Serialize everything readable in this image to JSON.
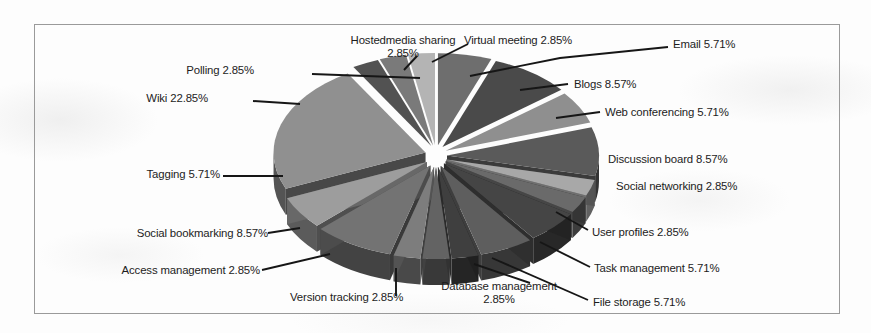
{
  "figure": {
    "type": "exploded-3d-pie",
    "border_color": "#9a9a9a",
    "background_color": "#fdfdfd"
  },
  "chart_data": {
    "type": "pie",
    "title": "",
    "subtitle": "",
    "xlabel": "",
    "ylabel": "",
    "legend_position": "none",
    "exploded": true,
    "three_d": true,
    "units": "percent",
    "categories": [
      "Email",
      "Blogs",
      "Web conferencing",
      "Discussion board",
      "Social networking",
      "User profiles",
      "Task management",
      "File storage",
      "Database management",
      "Version tracking",
      "Access management",
      "Social bookmarking",
      "Tagging",
      "Wiki",
      "Polling",
      "Hostedmedia sharing",
      "Virtual meeting"
    ],
    "values": [
      5.71,
      8.57,
      5.71,
      8.57,
      2.85,
      2.85,
      5.71,
      5.71,
      2.85,
      2.85,
      2.85,
      8.57,
      5.71,
      22.85,
      2.85,
      2.85,
      2.85
    ],
    "value_labels": [
      "5.71%",
      "8.57%",
      "5.71%",
      "8.57%",
      "2.85%",
      "2.85%",
      "5.71%",
      "5.71%",
      "2.85%",
      "2.85%",
      "2.85%",
      "8.57%",
      "5.71%",
      "22.85%",
      "2.85%",
      "2.85%",
      "2.85%"
    ],
    "slice_colors": [
      "#6e6e6e",
      "#4a4a4a",
      "#8f8f8f",
      "#5a5a5a",
      "#a8a8a8",
      "#6a6a6a",
      "#454545",
      "#5e5e5e",
      "#3f3f3f",
      "#636363",
      "#7d7d7d",
      "#737373",
      "#9d9d9d",
      "#909090",
      "#525252",
      "#7a7a7a",
      "#b4b4b4"
    ]
  },
  "labels": [
    {
      "id": "hostedmedia-sharing",
      "name": "Hostedmedia sharing",
      "percent": "2.85%",
      "text": "Hostedmedia sharing 2.85%"
    },
    {
      "id": "virtual-meeting",
      "name": "Virtual meeting",
      "percent": "2.85%",
      "text": "Virtual meeting 2.85%"
    },
    {
      "id": "email",
      "name": "Email",
      "percent": "5.71%",
      "text": "Email 5.71%"
    },
    {
      "id": "polling",
      "name": "Polling",
      "percent": "2.85%",
      "text": "Polling 2.85%"
    },
    {
      "id": "blogs",
      "name": "Blogs",
      "percent": "8.57%",
      "text": "Blogs 8.57%"
    },
    {
      "id": "wiki",
      "name": "Wiki",
      "percent": "22.85%",
      "text": "Wiki 22.85%"
    },
    {
      "id": "web-conferencing",
      "name": "Web conferencing",
      "percent": "5.71%",
      "text": "Web conferencing 5.71%"
    },
    {
      "id": "discussion-board",
      "name": "Discussion board",
      "percent": "8.57%",
      "text": "Discussion board 8.57%"
    },
    {
      "id": "social-networking",
      "name": "Social networking",
      "percent": "2.85%",
      "text": "Social networking 2.85%"
    },
    {
      "id": "tagging",
      "name": "Tagging",
      "percent": "5.71%",
      "text": "Tagging 5.71%"
    },
    {
      "id": "user-profiles",
      "name": "User profiles",
      "percent": "2.85%",
      "text": "User profiles 2.85%"
    },
    {
      "id": "social-bookmarking",
      "name": "Social bookmarking",
      "percent": "8.57%",
      "text": "Social bookmarking 8.57%"
    },
    {
      "id": "task-management",
      "name": "Task management",
      "percent": "5.71%",
      "text": "Task management 5.71%"
    },
    {
      "id": "access-management",
      "name": "Access management",
      "percent": "2.85%",
      "text": "Access management 2.85%"
    },
    {
      "id": "database-management",
      "name": "Database management",
      "percent": "2.85%",
      "text": "Database management 2.85%"
    },
    {
      "id": "version-tracking",
      "name": "Version tracking",
      "percent": "2.85%",
      "text": "Version tracking 2.85%"
    },
    {
      "id": "file-storage",
      "name": "File storage",
      "percent": "5.71%",
      "text": "File storage 5.71%"
    }
  ]
}
